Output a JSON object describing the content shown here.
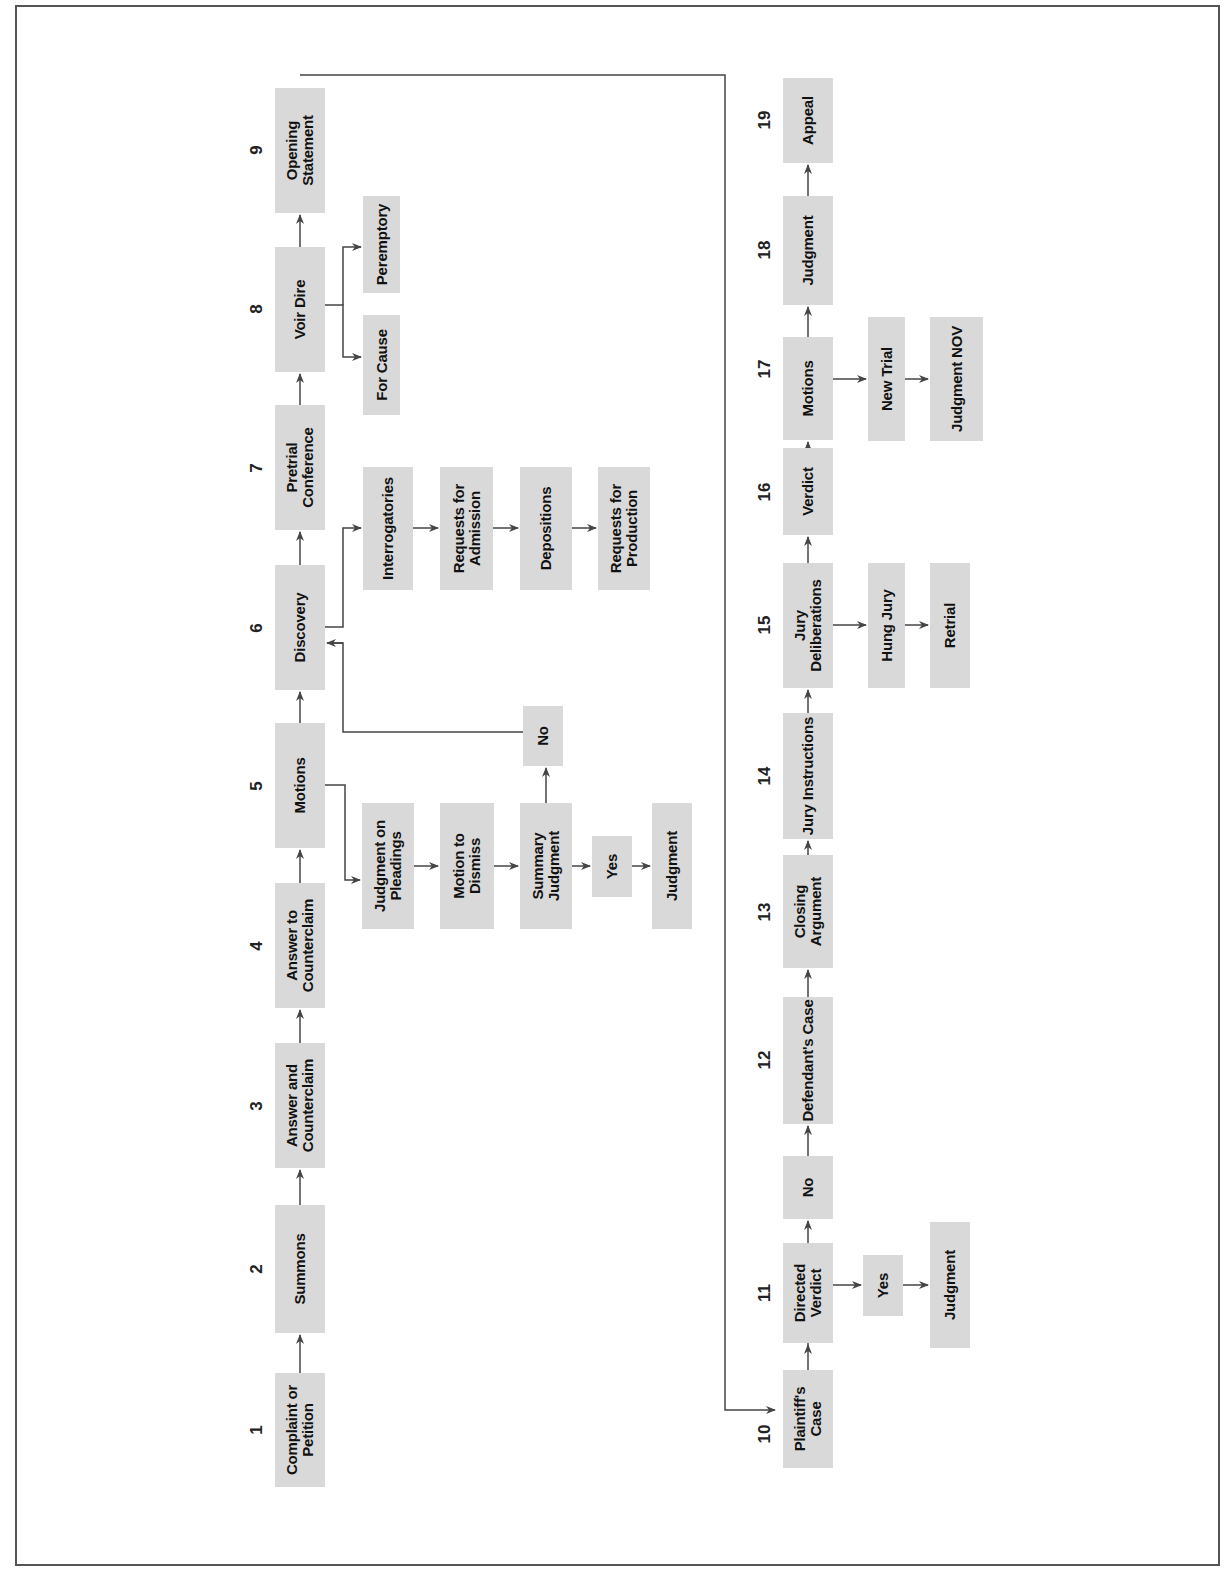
{
  "diagram": {
    "title": "",
    "orientation": "rotated -90deg (reads bottom-to-top)",
    "colors": {
      "box_fill": "#d9d9d9",
      "line": "#444444",
      "border": "#555555",
      "text": "#111111"
    },
    "steps": [
      {
        "number": "1",
        "label": "Complaint or Petition"
      },
      {
        "number": "2",
        "label": "Summons"
      },
      {
        "number": "3",
        "label": "Answer and Counterclaim"
      },
      {
        "number": "4",
        "label": "Answer to Counterclaim"
      },
      {
        "number": "5",
        "label": "Motions"
      },
      {
        "number": "6",
        "label": "Discovery"
      },
      {
        "number": "7",
        "label": "Pretrial Conference"
      },
      {
        "number": "8",
        "label": "Voir Dire"
      },
      {
        "number": "9",
        "label": "Opening Statement"
      },
      {
        "number": "10",
        "label": "Plaintiff's Case"
      },
      {
        "number": "11",
        "label": "Directed Verdict"
      },
      {
        "number": "12",
        "label": "Defendant's Case"
      },
      {
        "number": "13",
        "label": "Closing Argument"
      },
      {
        "number": "14",
        "label": "Jury Instructions"
      },
      {
        "number": "15",
        "label": "Jury Deliberations"
      },
      {
        "number": "16",
        "label": "Verdict"
      },
      {
        "number": "17",
        "label": "Motions"
      },
      {
        "number": "18",
        "label": "Judgment"
      },
      {
        "number": "19",
        "label": "Appeal"
      }
    ],
    "branches": {
      "motions_5": [
        "Judgment on Pleadings",
        "Motion to Dismiss",
        "Summary Judgment",
        "Yes",
        "Judgment",
        "No"
      ],
      "discovery_6": [
        "Interrogatories",
        "Requests for Admission",
        "Depositions",
        "Requests for Production"
      ],
      "voir_dire_8": [
        "For Cause",
        "Peremptory"
      ],
      "directed_verdict_11": [
        "Yes",
        "Judgment",
        "No"
      ],
      "jury_deliberations_15": [
        "Hung Jury",
        "Retrial"
      ],
      "motions_17": [
        "New Trial",
        "Judgment NOV"
      ]
    }
  }
}
